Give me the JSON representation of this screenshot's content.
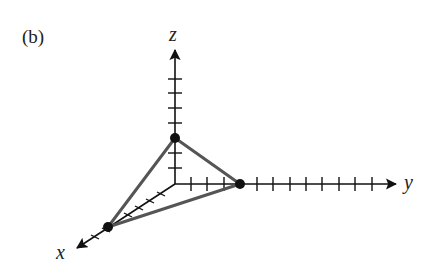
{
  "figure": {
    "panel_label": "(b)",
    "axes": {
      "x": {
        "label": "x",
        "origin": [
          175,
          184
        ],
        "tip": [
          75,
          249
        ],
        "ticks": 6
      },
      "y": {
        "label": "y",
        "origin": [
          175,
          184
        ],
        "tip": [
          398,
          184
        ],
        "ticks_x": [
          191,
          207,
          224,
          257,
          273,
          290,
          306,
          322,
          339,
          355,
          372
        ]
      },
      "z": {
        "label": "z",
        "origin": [
          175,
          184
        ],
        "tip": [
          175,
          47
        ],
        "ticks_y": [
          79,
          93,
          108,
          123,
          153,
          168
        ]
      }
    },
    "points": [
      {
        "name": "z-intercept",
        "at": [
          175,
          138
        ]
      },
      {
        "name": "y-intercept",
        "at": [
          240,
          184
        ]
      },
      {
        "name": "x-intercept",
        "at": [
          108,
          227
        ]
      }
    ],
    "triangle_color": "#555555",
    "axis_color": "#111111"
  }
}
